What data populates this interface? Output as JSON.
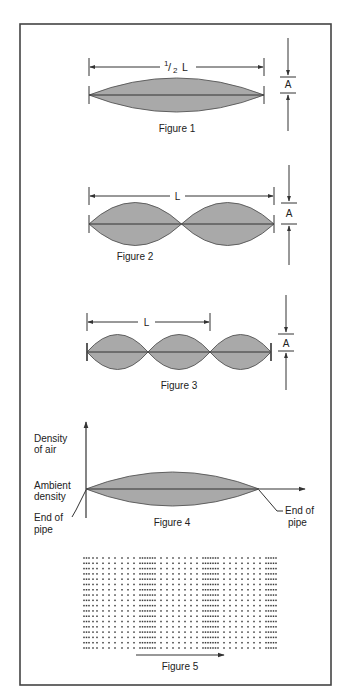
{
  "diagram": {
    "colors": {
      "frame": "#444444",
      "lobe_fill": "#a9a9a9",
      "lobe_stroke": "#555555",
      "line": "#333333",
      "dot": "#3a3a3a",
      "background": "#ffffff"
    },
    "figure1": {
      "caption": "Figure 1",
      "length_label_num": "1",
      "length_label_den": "2",
      "length_label_slash": "/",
      "length_label_var": "L",
      "amplitude_label": "A",
      "lobes": 1
    },
    "figure2": {
      "caption": "Figure 2",
      "length_label": "L",
      "amplitude_label": "A",
      "lobes": 2
    },
    "figure3": {
      "caption": "Figure 3",
      "length_label": "L",
      "amplitude_label": "A",
      "lobes": 3
    },
    "figure4": {
      "caption": "Figure 4",
      "y_axis_label_line1": "Density",
      "y_axis_label_line2": "of air",
      "baseline_label_line1": "Ambient",
      "baseline_label_line2": "density",
      "left_end_label_line1": "End of",
      "left_end_label_line2": "pipe",
      "right_end_label_line1": "End of",
      "right_end_label_line2": "pipe"
    },
    "figure5": {
      "caption": "Figure 5",
      "rows": 18,
      "column_x_positions": [
        84,
        86.5,
        89,
        93,
        97,
        103,
        109,
        115,
        122,
        128,
        134,
        140,
        142.5,
        145,
        147.5,
        150,
        152.5,
        155,
        161,
        167,
        173,
        179,
        185,
        191,
        197,
        203,
        205.5,
        208,
        210.5,
        213,
        215.5,
        218,
        224,
        230,
        236,
        242,
        248,
        254,
        260,
        266,
        268.5,
        271,
        273.5,
        276
      ]
    }
  }
}
